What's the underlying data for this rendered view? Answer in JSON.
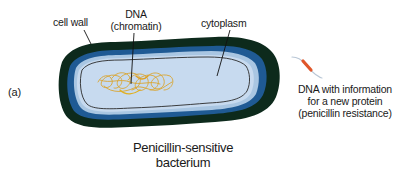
{
  "figure": {
    "panel_label": "(a)",
    "title_line1": "Penicillin-sensitive",
    "title_line2": "bacterium"
  },
  "labels": {
    "cell_wall": "cell wall",
    "dna_line1": "DNA",
    "dna_line2": "(chromatin)",
    "cytoplasm": "cytoplasm",
    "plasmid_line1": "DNA with information",
    "plasmid_line2": "for a new protein",
    "plasmid_line3": "(penicillin resistance)"
  },
  "colors": {
    "outer_wall": "#0d2a1c",
    "membrane": "#1f5a94",
    "membrane_inner": "#a9c6e2",
    "cytoplasm": "#c7daef",
    "inner_line": "#2a2a2a",
    "chromatin": "#d9a531",
    "plasmid_strand": "#b9c7d6",
    "plasmid_gene": "#e0562a",
    "text": "#1a1a1a"
  }
}
